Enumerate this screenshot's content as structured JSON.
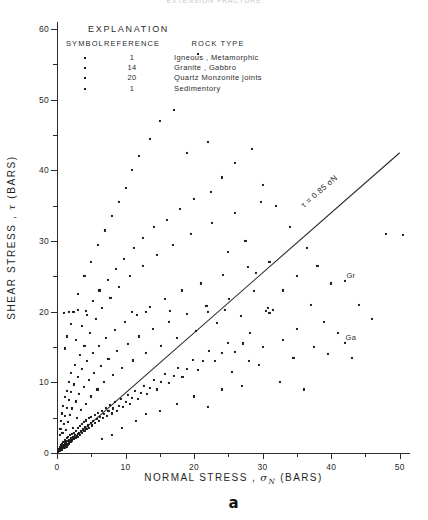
{
  "figure": {
    "cut_title": "EXTENSION  FRACTURE",
    "panel_label": "a"
  },
  "legend": {
    "title": "EXPLANATION",
    "headers": [
      "SYMBOL",
      "REFERENCE",
      "ROCK  TYPE"
    ],
    "rows": [
      {
        "symbol": "dot-marker",
        "reference": "1",
        "rock_type": "Igneous , Metamorphic"
      },
      {
        "symbol": "dot-marker",
        "reference": "14",
        "rock_type": "Granite , Gabbro"
      },
      {
        "symbol": "dot-marker",
        "reference": "20",
        "rock_type": "Quartz Monzonite joints"
      },
      {
        "symbol": "dot-marker",
        "reference": "1",
        "rock_type": "Sedimentory"
      }
    ]
  },
  "chart_data": {
    "type": "scatter",
    "title": "EXTENSION  FRACTURE",
    "xlabel": "NORMAL STRESS , σN (BARS)",
    "ylabel": "SHEAR STRESS , τ (BARS)",
    "xlim": [
      0,
      51.5
    ],
    "ylim": [
      0,
      61
    ],
    "xticks": [
      0,
      10,
      20,
      30,
      40,
      50
    ],
    "xticks_minor": [
      5,
      15,
      25,
      35,
      45
    ],
    "yticks": [
      0,
      10,
      20,
      30,
      40,
      50,
      60
    ],
    "yticks_minor": [
      5,
      15,
      25,
      35,
      45,
      55
    ],
    "xticklabels": [
      "0",
      "10",
      "20",
      "30",
      "40",
      "50"
    ],
    "yticklabels": [
      "0",
      "10",
      "20",
      "30",
      "40",
      "50",
      "60"
    ],
    "grid": false,
    "legend_position": "upper-left-inside",
    "marker": {
      "shape": "square",
      "size_px": 2.1,
      "color": "#1c1c1c"
    },
    "fit_line": {
      "label": "τ = 0.85 σN",
      "slope": 0.85,
      "intercept": 0,
      "x_range": [
        0,
        50
      ],
      "color": "#2b2b2b"
    },
    "point_annotations": [
      {
        "text": "Gr",
        "x": 42.0,
        "y": 24.3
      },
      {
        "text": "Ga",
        "x": 42.0,
        "y": 15.6
      }
    ],
    "points": [
      [
        0.2,
        0.2
      ],
      [
        0.3,
        0.3
      ],
      [
        0.35,
        0.5
      ],
      [
        0.4,
        0.3
      ],
      [
        0.45,
        0.6
      ],
      [
        0.5,
        0.4
      ],
      [
        0.5,
        0.8
      ],
      [
        0.55,
        0.5
      ],
      [
        0.6,
        0.7
      ],
      [
        0.6,
        1.1
      ],
      [
        0.7,
        0.5
      ],
      [
        0.7,
        0.9
      ],
      [
        0.75,
        1.3
      ],
      [
        0.8,
        0.7
      ],
      [
        0.8,
        1.0
      ],
      [
        0.85,
        1.5
      ],
      [
        0.9,
        0.8
      ],
      [
        0.95,
        1.2
      ],
      [
        1.0,
        0.9
      ],
      [
        1.0,
        1.6
      ],
      [
        1.05,
        1.1
      ],
      [
        1.1,
        0.7
      ],
      [
        1.15,
        1.4
      ],
      [
        1.2,
        1.0
      ],
      [
        1.2,
        1.9
      ],
      [
        1.3,
        1.2
      ],
      [
        1.35,
        1.6
      ],
      [
        1.4,
        0.9
      ],
      [
        1.45,
        2.1
      ],
      [
        1.5,
        1.3
      ],
      [
        1.5,
        1.7
      ],
      [
        1.6,
        1.1
      ],
      [
        1.65,
        2.3
      ],
      [
        1.7,
        1.5
      ],
      [
        1.75,
        1.9
      ],
      [
        1.8,
        1.3
      ],
      [
        1.9,
        2.5
      ],
      [
        1.9,
        1.7
      ],
      [
        2.0,
        1.5
      ],
      [
        2.0,
        2.1
      ],
      [
        2.1,
        1.9
      ],
      [
        2.2,
        2.7
      ],
      [
        2.2,
        1.7
      ],
      [
        2.3,
        2.3
      ],
      [
        2.4,
        2.0
      ],
      [
        2.5,
        2.9
      ],
      [
        2.5,
        2.2
      ],
      [
        2.6,
        2.5
      ],
      [
        2.7,
        2.1
      ],
      [
        2.8,
        3.1
      ],
      [
        2.9,
        2.4
      ],
      [
        3.0,
        2.7
      ],
      [
        3.0,
        3.5
      ],
      [
        3.1,
        2.3
      ],
      [
        3.2,
        2.9
      ],
      [
        3.3,
        3.8
      ],
      [
        3.4,
        2.6
      ],
      [
        3.5,
        3.1
      ],
      [
        3.6,
        4.1
      ],
      [
        3.7,
        2.9
      ],
      [
        3.8,
        3.4
      ],
      [
        3.9,
        4.4
      ],
      [
        4.0,
        3.1
      ],
      [
        4.1,
        3.7
      ],
      [
        4.2,
        4.6
      ],
      [
        4.3,
        3.4
      ],
      [
        4.5,
        3.9
      ],
      [
        4.6,
        4.9
      ],
      [
        4.7,
        3.6
      ],
      [
        4.9,
        4.2
      ],
      [
        5.0,
        5.1
      ],
      [
        5.1,
        3.9
      ],
      [
        5.3,
        4.5
      ],
      [
        5.5,
        5.4
      ],
      [
        5.6,
        4.2
      ],
      [
        5.8,
        4.8
      ],
      [
        6.0,
        5.7
      ],
      [
        6.1,
        4.5
      ],
      [
        6.3,
        5.1
      ],
      [
        6.5,
        6.0
      ],
      [
        6.7,
        4.9
      ],
      [
        6.9,
        5.5
      ],
      [
        7.1,
        6.4
      ],
      [
        7.3,
        5.2
      ],
      [
        7.5,
        5.9
      ],
      [
        7.7,
        6.8
      ],
      [
        8.0,
        5.6
      ],
      [
        8.2,
        6.3
      ],
      [
        8.5,
        7.2
      ],
      [
        8.7,
        6.0
      ],
      [
        9.0,
        6.7
      ],
      [
        9.3,
        7.7
      ],
      [
        9.6,
        6.5
      ],
      [
        10.0,
        7.2
      ],
      [
        10.3,
        8.2
      ],
      [
        10.6,
        7.0
      ],
      [
        11.0,
        7.8
      ],
      [
        11.4,
        8.8
      ],
      [
        11.8,
        7.6
      ],
      [
        12.2,
        8.5
      ],
      [
        12.7,
        9.5
      ],
      [
        13.1,
        8.3
      ],
      [
        13.6,
        9.2
      ],
      [
        14.1,
        10.3
      ],
      [
        14.6,
        9.0
      ],
      [
        15.2,
        10.0
      ],
      [
        15.8,
        11.2
      ],
      [
        16.3,
        9.9
      ],
      [
        17.0,
        10.9
      ],
      [
        17.6,
        12.1
      ],
      [
        18.3,
        10.8
      ],
      [
        19.0,
        11.9
      ],
      [
        19.8,
        13.2
      ],
      [
        20.5,
        11.8
      ],
      [
        21.3,
        13.0
      ],
      [
        22.2,
        14.4
      ],
      [
        23.0,
        13.0
      ],
      [
        24.0,
        14.2
      ],
      [
        25.0,
        15.6
      ],
      [
        26.0,
        14.3
      ],
      [
        27.1,
        15.5
      ],
      [
        28.2,
        17.0
      ],
      [
        0.4,
        2.6
      ],
      [
        0.5,
        3.4
      ],
      [
        0.6,
        4.5
      ],
      [
        0.7,
        5.6
      ],
      [
        0.8,
        2.9
      ],
      [
        0.9,
        6.7
      ],
      [
        1.0,
        4.1
      ],
      [
        1.1,
        7.9
      ],
      [
        1.2,
        5.3
      ],
      [
        1.3,
        3.2
      ],
      [
        1.4,
        8.8
      ],
      [
        1.5,
        6.4
      ],
      [
        1.6,
        4.4
      ],
      [
        1.7,
        10.0
      ],
      [
        1.8,
        7.5
      ],
      [
        1.9,
        5.4
      ],
      [
        2.0,
        11.3
      ],
      [
        2.1,
        8.6
      ],
      [
        2.2,
        6.3
      ],
      [
        2.3,
        3.6
      ],
      [
        2.5,
        9.7
      ],
      [
        2.6,
        12.5
      ],
      [
        2.7,
        7.3
      ],
      [
        2.9,
        5.0
      ],
      [
        3.0,
        10.8
      ],
      [
        3.2,
        8.3
      ],
      [
        3.4,
        13.9
      ],
      [
        3.5,
        6.1
      ],
      [
        3.7,
        11.9
      ],
      [
        3.9,
        9.3
      ],
      [
        4.0,
        15.1
      ],
      [
        4.2,
        7.0
      ],
      [
        4.4,
        13.0
      ],
      [
        4.6,
        10.3
      ],
      [
        4.8,
        17.0
      ],
      [
        5.0,
        8.0
      ],
      [
        5.2,
        14.1
      ],
      [
        5.4,
        11.3
      ],
      [
        5.7,
        19.0
      ],
      [
        5.9,
        9.0
      ],
      [
        6.1,
        15.2
      ],
      [
        6.4,
        12.3
      ],
      [
        6.6,
        20.5
      ],
      [
        6.9,
        10.0
      ],
      [
        7.2,
        16.3
      ],
      [
        7.5,
        13.3
      ],
      [
        7.8,
        22.0
      ],
      [
        8.1,
        11.0
      ],
      [
        8.4,
        17.4
      ],
      [
        8.8,
        14.4
      ],
      [
        9.1,
        23.5
      ],
      [
        9.5,
        12.1
      ],
      [
        9.9,
        18.5
      ],
      [
        10.3,
        15.4
      ],
      [
        10.7,
        25.0
      ],
      [
        11.1,
        13.1
      ],
      [
        11.6,
        19.6
      ],
      [
        12.0,
        16.5
      ],
      [
        12.5,
        26.5
      ],
      [
        13.0,
        14.2
      ],
      [
        13.5,
        20.7
      ],
      [
        14.0,
        17.5
      ],
      [
        14.6,
        28.0
      ],
      [
        15.1,
        15.2
      ],
      [
        15.7,
        21.8
      ],
      [
        16.3,
        18.6
      ],
      [
        16.9,
        29.5
      ],
      [
        17.5,
        16.3
      ],
      [
        18.2,
        23.0
      ],
      [
        18.9,
        19.7
      ],
      [
        19.6,
        31.0
      ],
      [
        20.3,
        17.3
      ],
      [
        21.0,
        24.0
      ],
      [
        21.8,
        20.8
      ],
      [
        22.6,
        32.5
      ],
      [
        23.4,
        18.4
      ],
      [
        24.2,
        25.2
      ],
      [
        25.1,
        21.8
      ],
      [
        26.0,
        34.0
      ],
      [
        26.9,
        19.4
      ],
      [
        27.8,
        26.3
      ],
      [
        28.8,
        22.9
      ],
      [
        29.8,
        35.5
      ],
      [
        30.8,
        20.5
      ],
      [
        1.2,
        14.8
      ],
      [
        1.5,
        16.5
      ],
      [
        2.0,
        18.3
      ],
      [
        2.4,
        20.0
      ],
      [
        3.0,
        22.5
      ],
      [
        4.0,
        25.0
      ],
      [
        5.0,
        27.0
      ],
      [
        6.0,
        29.5
      ],
      [
        7.0,
        31.5
      ],
      [
        8.0,
        33.5
      ],
      [
        9.0,
        35.5
      ],
      [
        10.0,
        37.5
      ],
      [
        11.0,
        40.0
      ],
      [
        12.0,
        42.0
      ],
      [
        13.5,
        44.5
      ],
      [
        15.0,
        47.0
      ],
      [
        17.0,
        48.5
      ],
      [
        19.0,
        42.5
      ],
      [
        20.5,
        56.5
      ],
      [
        22.0,
        44.0
      ],
      [
        24.0,
        39.0
      ],
      [
        26.0,
        41.0
      ],
      [
        28.5,
        43.0
      ],
      [
        30.0,
        38.0
      ],
      [
        32.0,
        35.0
      ],
      [
        34.0,
        32.0
      ],
      [
        36.5,
        29.0
      ],
      [
        38.0,
        26.5
      ],
      [
        40.0,
        24.0
      ],
      [
        42.0,
        24.3
      ],
      [
        42.0,
        15.6
      ],
      [
        44.0,
        21.0
      ],
      [
        46.0,
        19.0
      ],
      [
        48.0,
        31.0
      ],
      [
        50.5,
        30.8
      ],
      [
        2.8,
        16.0
      ],
      [
        3.6,
        18.0
      ],
      [
        4.4,
        19.5
      ],
      [
        5.2,
        21.5
      ],
      [
        6.2,
        23.0
      ],
      [
        7.4,
        24.5
      ],
      [
        8.6,
        26.0
      ],
      [
        9.8,
        27.5
      ],
      [
        11.2,
        29.0
      ],
      [
        12.6,
        30.5
      ],
      [
        14.2,
        32.0
      ],
      [
        16.0,
        33.0
      ],
      [
        18.0,
        34.5
      ],
      [
        20.0,
        36.0
      ],
      [
        22.5,
        37.0
      ],
      [
        25.0,
        28.5
      ],
      [
        27.5,
        30.0
      ],
      [
        29.0,
        25.5
      ],
      [
        31.0,
        27.0
      ],
      [
        33.0,
        23.0
      ],
      [
        35.0,
        25.0
      ],
      [
        37.0,
        21.0
      ],
      [
        39.0,
        18.5
      ],
      [
        41.0,
        17.0
      ],
      [
        43.0,
        13.5
      ],
      [
        1.0,
        19.8
      ],
      [
        1.8,
        19.9
      ],
      [
        3.0,
        20.2
      ],
      [
        4.2,
        20.1
      ],
      [
        11.0,
        20.0
      ],
      [
        13.0,
        19.9
      ],
      [
        16.5,
        20.1
      ],
      [
        22.0,
        20.0
      ],
      [
        24.5,
        20.2
      ],
      [
        30.5,
        20.1
      ],
      [
        31.0,
        19.8
      ],
      [
        31.5,
        20.3
      ],
      [
        25.5,
        11.5
      ],
      [
        27.0,
        9.5
      ],
      [
        29.5,
        12.5
      ],
      [
        32.5,
        10.0
      ],
      [
        34.5,
        13.5
      ],
      [
        36.0,
        9.0
      ],
      [
        20.0,
        8.0
      ],
      [
        22.0,
        6.5
      ],
      [
        24.0,
        9.0
      ],
      [
        17.5,
        7.0
      ],
      [
        15.0,
        6.0
      ],
      [
        13.0,
        5.5
      ],
      [
        11.5,
        4.5
      ],
      [
        9.5,
        3.5
      ],
      [
        8.0,
        2.5
      ],
      [
        6.5,
        2.0
      ],
      [
        35.0,
        17.5
      ],
      [
        37.5,
        15.0
      ],
      [
        39.5,
        14.0
      ],
      [
        33.0,
        16.0
      ],
      [
        30.0,
        15.0
      ],
      [
        28.0,
        13.0
      ]
    ]
  }
}
